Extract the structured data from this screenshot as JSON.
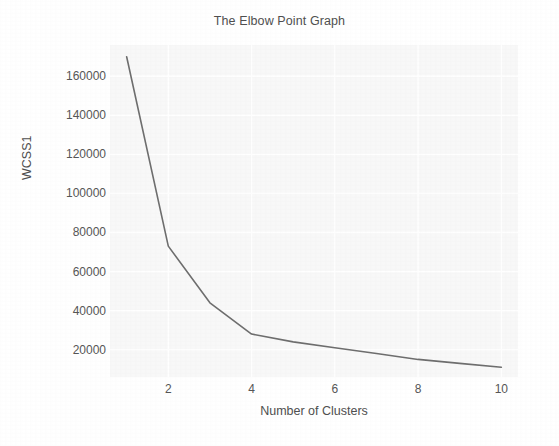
{
  "chart_data": {
    "type": "line",
    "title": "The Elbow Point Graph",
    "xlabel": "Number of Clusters",
    "ylabel": "WCSS1",
    "x": [
      1,
      2,
      3,
      4,
      5,
      6,
      7,
      8,
      9,
      10
    ],
    "values": [
      170000,
      73000,
      44000,
      28000,
      24000,
      21000,
      18000,
      15000,
      13000,
      11000
    ],
    "series": [
      {
        "name": "WCSS1",
        "values": [
          170000,
          73000,
          44000,
          28000,
          24000,
          21000,
          18000,
          15000,
          13000,
          11000
        ]
      }
    ],
    "xtick_labels": [
      "2",
      "4",
      "6",
      "8",
      "10"
    ],
    "xtick_values": [
      2,
      4,
      6,
      8,
      10
    ],
    "ytick_labels": [
      "20000",
      "40000",
      "60000",
      "80000",
      "100000",
      "120000",
      "140000",
      "160000"
    ],
    "ytick_values": [
      20000,
      40000,
      60000,
      80000,
      100000,
      120000,
      140000,
      160000
    ],
    "xlim": [
      0.6,
      10.4
    ],
    "ylim": [
      6000,
      176000
    ],
    "grid": true,
    "legend": false,
    "legend_position": "none",
    "line_color": "#6e6e6e",
    "grid_color": "#ffffff",
    "plot_background": "#f8f8f8",
    "figure_background": "#ffffff",
    "text_color": "#565656",
    "marker": "none",
    "line_width": 1.6
  }
}
